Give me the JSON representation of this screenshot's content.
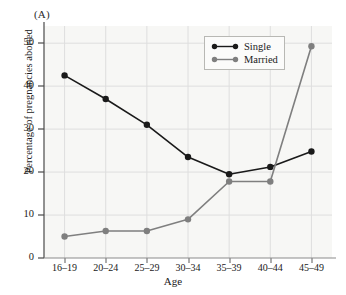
{
  "figure": {
    "panel_label": "(A)",
    "background_color": "#f7f7f5",
    "page_background": "#ffffff"
  },
  "legend": {
    "position": "top-right",
    "entries": [
      {
        "label": "Single",
        "color": "#1a1a1a"
      },
      {
        "label": "Married",
        "color": "#7f7f7f"
      }
    ]
  },
  "axes": {
    "x": {
      "label": "Age",
      "tick_labels": [
        "16–19",
        "20–24",
        "25–29",
        "30–34",
        "35–39",
        "40–44",
        "45–49"
      ]
    },
    "y": {
      "label": "Percentage of pregnancies aborted",
      "tick_labels": [
        "0",
        "10",
        "20",
        "30",
        "40",
        "50"
      ],
      "ticks": [
        0,
        10,
        20,
        30,
        40,
        50
      ],
      "min": 0,
      "max": 54
    }
  },
  "chart_data": {
    "type": "line",
    "title": "",
    "subtitle": "",
    "xlabel": "Age",
    "ylabel": "Percentage of pregnancies aborted",
    "categories": [
      "16–19",
      "20–24",
      "25–29",
      "30–34",
      "35–39",
      "40–44",
      "45–49"
    ],
    "series": [
      {
        "name": "Single",
        "color": "#1a1a1a",
        "values": [
          42.5,
          37.0,
          31.0,
          23.5,
          19.5,
          21.2,
          24.8
        ]
      },
      {
        "name": "Married",
        "color": "#7f7f7f",
        "values": [
          5.0,
          6.3,
          6.3,
          9.0,
          17.8,
          17.8,
          49.3
        ]
      }
    ],
    "ylim": [
      0,
      54
    ],
    "ytick_values": [
      0,
      10,
      20,
      30,
      40,
      50
    ],
    "grid": true,
    "grid_color": "#dedede",
    "legend_position": "top-right",
    "marker": "circle",
    "annotations": [
      "(A)"
    ]
  }
}
